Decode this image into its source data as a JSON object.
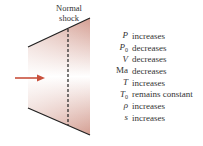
{
  "diagram": {
    "shock_label_line1": "Normal",
    "shock_label_line2": "shock",
    "colors": {
      "arrow": "#c8503c",
      "wall": "#222222",
      "gradient": "#d9a79c"
    }
  },
  "properties": [
    {
      "symbol": "P",
      "subscript": "",
      "italic": true,
      "change": "increases"
    },
    {
      "symbol": "P",
      "subscript": "0",
      "italic": true,
      "change": "decreases"
    },
    {
      "symbol": "V",
      "subscript": "",
      "italic": true,
      "change": "decreases"
    },
    {
      "symbol": "Ma",
      "subscript": "",
      "italic": false,
      "change": "decreases"
    },
    {
      "symbol": "T",
      "subscript": "",
      "italic": true,
      "change": "increases"
    },
    {
      "symbol": "T",
      "subscript": "0",
      "italic": true,
      "change": "remains constant"
    },
    {
      "symbol": "ρ",
      "subscript": "",
      "italic": true,
      "change": "increases"
    },
    {
      "symbol": "s",
      "subscript": "",
      "italic": true,
      "change": "increases"
    }
  ]
}
